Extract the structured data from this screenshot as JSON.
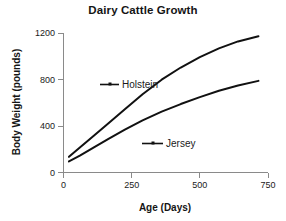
{
  "chart_data": {
    "type": "line",
    "title": "Dairy Cattle Growth",
    "xlabel": "Age (Days)",
    "ylabel": "Body Weight (pounds)",
    "xlim": [
      0,
      750
    ],
    "ylim": [
      0,
      1200
    ],
    "xticks": [
      "0",
      "250",
      "500",
      "750"
    ],
    "yticks": [
      "0",
      "400",
      "800",
      "1200"
    ],
    "grid": false,
    "legend_position": "inline-annotations",
    "series": [
      {
        "name": "Holstein",
        "x": [
          20,
          60,
          110,
          165,
          225,
          290,
          360,
          430,
          500,
          570,
          640,
          715
        ],
        "values": [
          135,
          215,
          315,
          425,
          545,
          675,
          800,
          905,
          995,
          1070,
          1130,
          1175
        ]
      },
      {
        "name": "Jersey",
        "x": [
          20,
          60,
          110,
          165,
          225,
          290,
          360,
          430,
          500,
          570,
          640,
          715
        ],
        "values": [
          95,
          145,
          215,
          290,
          370,
          450,
          525,
          590,
          650,
          705,
          750,
          790
        ]
      }
    ],
    "annotations": [
      {
        "text": "Holstein",
        "x": 300,
        "y": 880
      },
      {
        "text": "Jersey",
        "x": 470,
        "y": 370
      }
    ],
    "colors": {
      "line": "#111111",
      "axis": "#8a8a8a",
      "background": "#ffffff",
      "text": "#1a1a1a"
    }
  }
}
